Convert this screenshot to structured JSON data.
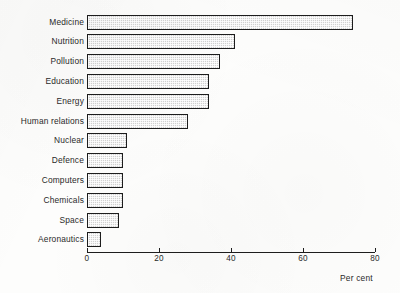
{
  "chart_data": {
    "type": "bar",
    "orientation": "horizontal",
    "title": "",
    "subtitle": "",
    "xlabel": "Per cent",
    "ylabel": "",
    "xlim": [
      0,
      80
    ],
    "xticks": [
      0,
      20,
      40,
      60,
      80
    ],
    "xtick_labels": [
      "0",
      "20",
      "40",
      "60",
      "80"
    ],
    "grid": false,
    "legend": null,
    "categories": [
      "Medicine",
      "Nutrition",
      "Pollution",
      "Education",
      "Energy",
      "Human relations",
      "Nuclear",
      "Defence",
      "Computers",
      "Chemicals",
      "Space",
      "Aeronautics"
    ],
    "values": [
      74,
      41,
      37,
      34,
      34,
      28,
      11,
      10,
      10,
      10,
      9,
      4
    ],
    "bar_fill_color": "#d2d2d2",
    "bar_edge_color": "#1d1d1d",
    "axis_color": "#1d1d1d",
    "background_color": "#fdfdfc"
  },
  "axis": {
    "x_title": "Per cent"
  }
}
